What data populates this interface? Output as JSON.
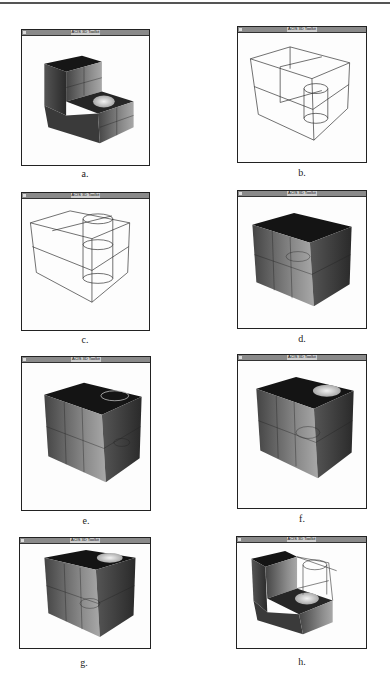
{
  "figure": {
    "window_title": "ACIS 3D Toolkit",
    "panels": [
      {
        "id": "a",
        "caption": "a.",
        "render": "shaded",
        "description": "L-shaped block with cylindrical hole in lower step"
      },
      {
        "id": "b",
        "caption": "b.",
        "render": "wireframe",
        "description": "Wireframe block with short cylinder"
      },
      {
        "id": "c",
        "caption": "c.",
        "render": "wireframe",
        "description": "Wireframe block with tall cylinder"
      },
      {
        "id": "d",
        "caption": "d.",
        "render": "shaded",
        "description": "Solid block"
      },
      {
        "id": "e",
        "caption": "e.",
        "render": "shaded",
        "description": "Solid block with circle outline on top"
      },
      {
        "id": "f",
        "caption": "f.",
        "render": "shaded",
        "description": "Solid block with cylindrical hole on top"
      },
      {
        "id": "g",
        "caption": "g.",
        "render": "shaded",
        "description": "Solid block with cylindrical hole on top"
      },
      {
        "id": "h",
        "caption": "h.",
        "render": "shaded",
        "description": "L-shaped block with wireframe removed section and hole"
      }
    ]
  }
}
